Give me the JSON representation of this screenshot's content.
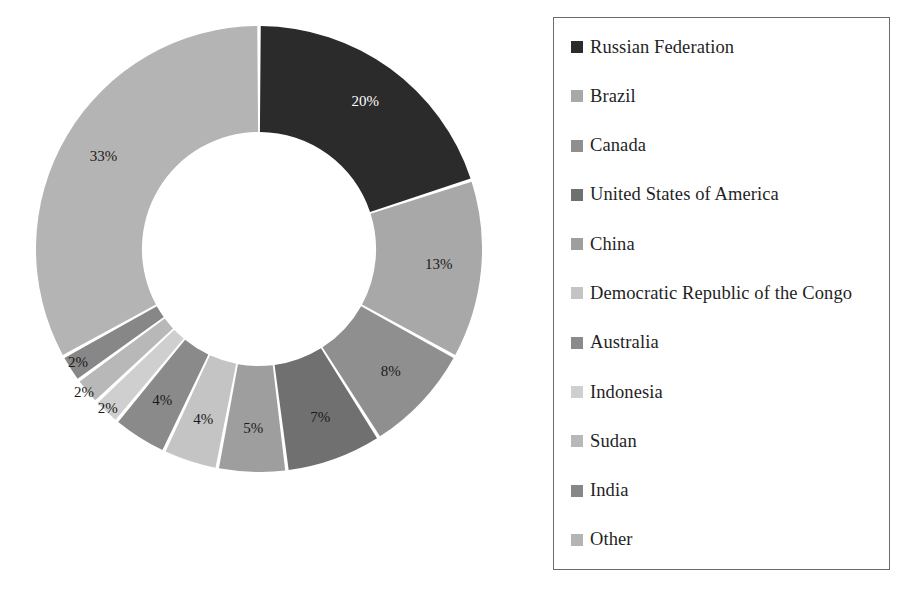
{
  "chart_data": {
    "type": "pie",
    "variant": "donut",
    "title": "",
    "subtitle": "",
    "xlabel": "",
    "ylabel": "",
    "units": "percent",
    "start_angle_deg": 0,
    "direction": "clockwise",
    "inner_radius_ratio": 0.525,
    "legend_position": "right",
    "grid": false,
    "total": 100,
    "categories": [
      "Russian Federation",
      "Brazil",
      "Canada",
      "United States of America",
      "China",
      "Democratic Republic of the Congo",
      "Australia",
      "Indonesia",
      "Sudan",
      "India",
      "Other"
    ],
    "values": [
      20,
      13,
      8,
      7,
      5,
      4,
      4,
      2,
      2,
      2,
      33
    ],
    "data_labels": [
      "20%",
      "13%",
      "8%",
      "7%",
      "5%",
      "4%",
      "4%",
      "2%",
      "2%",
      "2%",
      "33%"
    ],
    "colors": [
      "#2b2b2b",
      "#a8a8a8",
      "#8f8f8f",
      "#707070",
      "#9e9e9e",
      "#c4c4c4",
      "#8a8a8a",
      "#cfcfcf",
      "#b8b8b8",
      "#878787",
      "#b4b4b4"
    ],
    "label_text_colors": [
      "#ffffff",
      "#1a1a1a",
      "#1a1a1a",
      "#1a1a1a",
      "#1a1a1a",
      "#1a1a1a",
      "#1a1a1a",
      "#1a1a1a",
      "#1a1a1a",
      "#1a1a1a",
      "#1a1a1a"
    ]
  },
  "legend": {
    "border_color": "#6b6b6b",
    "items": [
      {
        "label": "Russian Federation",
        "color": "#2b2b2b"
      },
      {
        "label": "Brazil",
        "color": "#a8a8a8"
      },
      {
        "label": "Canada",
        "color": "#8f8f8f"
      },
      {
        "label": "United States of America",
        "color": "#707070"
      },
      {
        "label": "China",
        "color": "#9e9e9e"
      },
      {
        "label": "Democratic Republic of the Congo",
        "color": "#c4c4c4"
      },
      {
        "label": "Australia",
        "color": "#8a8a8a"
      },
      {
        "label": "Indonesia",
        "color": "#cfcfcf"
      },
      {
        "label": "Sudan",
        "color": "#b8b8b8"
      },
      {
        "label": "India",
        "color": "#878787"
      },
      {
        "label": "Other",
        "color": "#b4b4b4"
      }
    ]
  }
}
